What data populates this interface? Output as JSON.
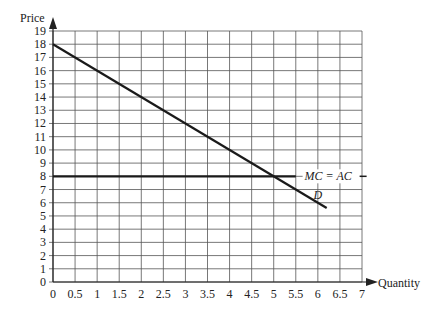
{
  "chart_data": {
    "type": "line",
    "title": "",
    "xlabel": "Quantity",
    "ylabel": "Price",
    "xlim": [
      0,
      7
    ],
    "ylim": [
      0,
      19
    ],
    "grid": true,
    "x_ticks": [
      "0",
      "0.5",
      "1",
      "1.5",
      "2",
      "2.5",
      "3",
      "3.5",
      "4",
      "4.5",
      "5",
      "5.5",
      "6",
      "6.5",
      "7"
    ],
    "y_ticks": [
      "0",
      "1",
      "2",
      "3",
      "4",
      "5",
      "6",
      "7",
      "8",
      "9",
      "10",
      "11",
      "12",
      "13",
      "14",
      "15",
      "16",
      "17",
      "18",
      "19"
    ],
    "series": [
      {
        "name": "D",
        "label": "D",
        "x": [
          0,
          6.2
        ],
        "y": [
          18,
          5.6
        ],
        "note": "Demand: P = 18 - 2Q"
      },
      {
        "name": "MC = AC",
        "label": "MC = AC",
        "x": [
          0,
          5.5
        ],
        "y": [
          8,
          8
        ]
      }
    ],
    "annotations": [
      {
        "text": "MC = AC",
        "x": 5.7,
        "y": 8
      },
      {
        "text": "D",
        "x": 5.9,
        "y": 6.6
      }
    ]
  }
}
